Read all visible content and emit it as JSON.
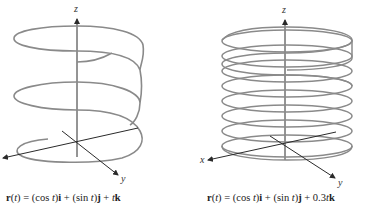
{
  "figures": [
    {
      "id": "left",
      "caption": {
        "r": "r",
        "t_open": "(",
        "t": "t",
        "t_close": ")",
        "eq": " = (cos ",
        "t2": "t",
        "p1": ")",
        "i": "i",
        "plus1": " + (sin ",
        "t3": "t",
        "p2": ")",
        "j": "j",
        "plus2": " + ",
        "coef": "",
        "t4": "t",
        "k": "k"
      },
      "axes": {
        "z": "z",
        "y": "y",
        "x": ""
      },
      "helix": {
        "turns": 2.75,
        "z_coef": 1,
        "description": "helix r(t) = (cos t)i + (sin t)j + tk"
      }
    },
    {
      "id": "right",
      "caption": {
        "r": "r",
        "t_open": "(",
        "t": "t",
        "t_close": ")",
        "eq": " = (cos ",
        "t2": "t",
        "p1": ")",
        "i": "i",
        "plus1": " + (sin ",
        "t3": "t",
        "p2": ")",
        "j": "j",
        "plus2": " + 0.3",
        "coef": "",
        "t4": "t",
        "k": "k"
      },
      "axes": {
        "z": "z",
        "y": "y",
        "x": "x"
      },
      "helix": {
        "turns": 9,
        "z_coef": 0.3,
        "description": "tightly wound helix r(t) = (cos t)i + (sin t)j + 0.3tk"
      }
    }
  ],
  "colors": {
    "helix": "#8a8a8a",
    "axis": "#2a2a2a",
    "text": "#222222"
  }
}
